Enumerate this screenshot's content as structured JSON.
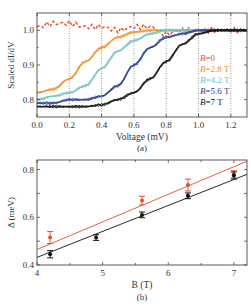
{
  "chart_data": [
    {
      "type": "line",
      "panel_label": "(a)",
      "xlabel": "Voltage (mV)",
      "ylabel": "Scaled dI/dV",
      "xlim": [
        0.0,
        1.3
      ],
      "ylim": [
        0.75,
        1.05
      ],
      "xticks": [
        "0.0",
        "0.2",
        "0.4",
        "0.6",
        "0.8",
        "1.0",
        "1.2"
      ],
      "yticks": [
        "0.8",
        "0.9",
        "1.0"
      ],
      "grid": "vertical dotted at 0.2,0.4,0.6,0.8,1.0,1.2",
      "legend_position": "right-inside",
      "series": [
        {
          "name": "B=0",
          "label_italic": "B",
          "label_rest": "=0",
          "color": "#e0502a",
          "x": [
            0.0,
            0.1,
            0.2,
            0.3,
            0.4,
            0.5,
            0.6,
            0.7,
            0.8,
            0.9,
            1.0,
            1.1,
            1.2,
            1.3
          ],
          "y": [
            1.01,
            1.02,
            1.02,
            1.01,
            1.01,
            1.0,
            1.01,
            1.01,
            0.99,
            1.0,
            1.0,
            1.0,
            1.0,
            1.0
          ]
        },
        {
          "name": "B=2.8 T",
          "label_italic": "B",
          "label_rest": "=2.8 T",
          "color": "#f0922b",
          "x": [
            0.0,
            0.1,
            0.2,
            0.3,
            0.4,
            0.5,
            0.6,
            0.7,
            0.8,
            0.9,
            1.0,
            1.1,
            1.2,
            1.3
          ],
          "y": [
            0.82,
            0.83,
            0.86,
            0.91,
            0.95,
            0.98,
            0.995,
            1.0,
            1.0,
            1.0,
            1.0,
            1.0,
            1.0,
            1.0
          ]
        },
        {
          "name": "B=4.2 T",
          "label_italic": "B",
          "label_rest": "=4.2 T",
          "color": "#6fc3c8",
          "x": [
            0.0,
            0.1,
            0.2,
            0.3,
            0.4,
            0.5,
            0.6,
            0.7,
            0.8,
            0.9,
            1.0,
            1.1,
            1.2,
            1.3
          ],
          "y": [
            0.8,
            0.81,
            0.82,
            0.84,
            0.89,
            0.94,
            0.97,
            0.99,
            1.0,
            1.0,
            1.0,
            1.0,
            1.0,
            1.0
          ]
        },
        {
          "name": "B=5.6 T",
          "label_italic": "B",
          "label_rest": "=5.6 T",
          "color": "#2a3f8f",
          "x": [
            0.0,
            0.1,
            0.2,
            0.3,
            0.4,
            0.5,
            0.6,
            0.7,
            0.8,
            0.9,
            1.0,
            1.1,
            1.2,
            1.3
          ],
          "y": [
            0.79,
            0.79,
            0.8,
            0.8,
            0.81,
            0.84,
            0.9,
            0.95,
            0.98,
            0.99,
            1.0,
            1.0,
            1.0,
            1.0
          ]
        },
        {
          "name": "B=7 T",
          "label_italic": "B",
          "label_rest": "=7 T",
          "color": "#111111",
          "x": [
            0.0,
            0.1,
            0.2,
            0.3,
            0.4,
            0.5,
            0.6,
            0.7,
            0.8,
            0.9,
            1.0,
            1.1,
            1.2,
            1.3
          ],
          "y": [
            0.78,
            0.78,
            0.78,
            0.78,
            0.785,
            0.8,
            0.82,
            0.86,
            0.91,
            0.96,
            0.99,
            1.0,
            1.0,
            1.0
          ]
        }
      ]
    },
    {
      "type": "scatter",
      "panel_label": "(b)",
      "xlabel": "B (T)",
      "ylabel": "Δ (meV)",
      "xlim": [
        4.0,
        7.2
      ],
      "ylim": [
        0.4,
        0.84
      ],
      "xticks": [
        "4",
        "5",
        "6",
        "7"
      ],
      "yticks": [
        "0.4",
        "0.6",
        "0.8"
      ],
      "grid": false,
      "series": [
        {
          "name": "red",
          "color": "#e0502a",
          "x": [
            4.2,
            5.6,
            6.3,
            7.0
          ],
          "y": [
            0.515,
            0.67,
            0.735,
            0.78
          ],
          "err": [
            0.025,
            0.018,
            0.025,
            0.015
          ],
          "fit": {
            "x": [
              4.0,
              7.2
            ],
            "y": [
              0.465,
              0.835
            ]
          }
        },
        {
          "name": "black",
          "color": "#111111",
          "x": [
            4.2,
            4.9,
            5.6,
            6.3,
            7.0
          ],
          "y": [
            0.445,
            0.515,
            0.61,
            0.69,
            0.775
          ],
          "err": [
            0.015,
            0.012,
            0.012,
            0.012,
            0.015
          ],
          "fit": {
            "x": [
              4.0,
              7.2
            ],
            "y": [
              0.432,
              0.78
            ]
          }
        }
      ]
    }
  ]
}
